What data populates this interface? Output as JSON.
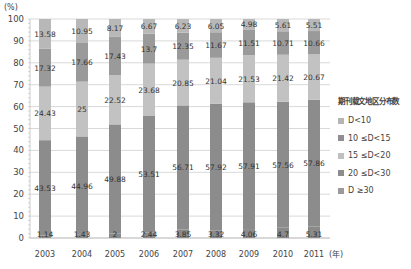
{
  "chart_data": {
    "type": "bar",
    "stacked": true,
    "title": "",
    "xlabel": "(年)",
    "ylabel": "(%)",
    "ylim": [
      0,
      100
    ],
    "yticks": [
      0,
      10,
      20,
      30,
      40,
      50,
      60,
      70,
      80,
      90,
      100
    ],
    "categories": [
      "2003",
      "2004",
      "2005",
      "2006",
      "2007",
      "2008",
      "2009",
      "2010",
      "2011"
    ],
    "legend_title": "期刊载文地区分布数",
    "legend_position": "right",
    "grid": true,
    "series": [
      {
        "name": "D≥30",
        "color": "#8c8c8c",
        "values": [
          1.14,
          1.43,
          2,
          2.44,
          3.85,
          3.32,
          4.06,
          4.7,
          5.31
        ]
      },
      {
        "name": "20≤D<30",
        "color": "#8c8c8c",
        "values": [
          43.53,
          44.96,
          49.88,
          53.51,
          56.71,
          57.92,
          57.91,
          57.56,
          57.86
        ]
      },
      {
        "name": "15≤D<20",
        "color": "#c0c0c0",
        "values": [
          24.43,
          25,
          22.52,
          23.68,
          20.85,
          21.04,
          21.53,
          21.42,
          20.67
        ]
      },
      {
        "name": "10≤D<15",
        "color": "#9a9a9a",
        "values": [
          17.32,
          17.66,
          17.43,
          13.7,
          12.35,
          11.67,
          11.51,
          10.71,
          10.66
        ]
      },
      {
        "name": "D<10",
        "color": "#b5b5b5",
        "values": [
          13.58,
          10.95,
          8.17,
          6.67,
          6.23,
          6.05,
          4.98,
          5.61,
          5.51
        ]
      }
    ]
  },
  "legend": {
    "title": "期刊载文地区分布数",
    "items": [
      {
        "label": "D<10",
        "color": "#b5b5b5"
      },
      {
        "label": "10 ≤D<15",
        "color": "#8f8f8f"
      },
      {
        "label": "15 ≤D<20",
        "color": "#c0c0c0"
      },
      {
        "label": "20 ≤D<30",
        "color": "#8c8c8c"
      },
      {
        "label": "D ≥30",
        "color": "#9a9a9a"
      }
    ]
  },
  "axis": {
    "y_unit": "(%)",
    "x_unit": "(年)"
  }
}
